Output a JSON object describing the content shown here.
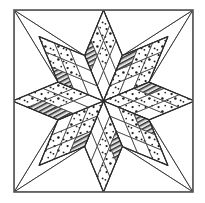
{
  "figure": {
    "name": "eight-pointed-star-quilt-block",
    "title": "Eight-Pointed Star Quilt Block",
    "alt_title": "LeMoyne Star / Lone Star patchwork block diagram",
    "description": "Line-drawing diagram of a square patchwork quilt block containing an eight-pointed star. Each star point is a large diamond pieced from a three-by-three grid of smaller diamonds in dotted and dark-striped fabrics. Plain white squares fill the four corners and plain white triangles fill the four side openings.",
    "width": 205,
    "height": 203
  },
  "frame": {
    "x": 14,
    "y": 10,
    "width": 179,
    "height": 182,
    "stroke": "#555555",
    "stroke_width": 1.6,
    "fill": "#ffffff",
    "label": "block-outer-border"
  },
  "geometry": {
    "center_x": 103.5,
    "center_y": 101.0,
    "star_radius": 91.0,
    "point_half_angle_deg": 22.5,
    "subdivisions": 3,
    "point_count": 8
  },
  "colors": {
    "ink": "#2a2a2a",
    "line": "#3b3b3b",
    "frame": "#555555",
    "paper": "#ffffff",
    "plain_fill": "#ffffff",
    "dot_ink": "#1d1d1d",
    "stripe_dark": "#2b2b2b",
    "stripe_mid": "#6f6f6f",
    "stripe_light": "#bdbdbd"
  },
  "fabrics": [
    {
      "id": "plain",
      "label": "Plain white solid",
      "swatch": "#ffffff",
      "texture": "none"
    },
    {
      "id": "dotted",
      "label": "Dotted print",
      "swatch": "#f7f7f7",
      "texture": "scattered-dots"
    },
    {
      "id": "stripe",
      "label": "Dark diagonal stripe",
      "swatch": "#3a3a3a",
      "texture": "diagonal-hatch"
    }
  ],
  "star_points": [
    {
      "index": 0,
      "name": "star-point-n",
      "direction": "north",
      "angle_deg": 270,
      "cells": [
        [
          "plain",
          "plain",
          "plain"
        ],
        [
          "plain",
          "dotted",
          "dotted"
        ],
        [
          "stripe",
          "dotted",
          "dotted"
        ]
      ]
    },
    {
      "index": 1,
      "name": "star-point-ne",
      "direction": "northeast",
      "angle_deg": 315,
      "cells": [
        [
          "dotted",
          "plain",
          "dotted"
        ],
        [
          "dotted",
          "dotted",
          "dotted"
        ],
        [
          "stripe",
          "dotted",
          "dotted"
        ]
      ]
    },
    {
      "index": 2,
      "name": "star-point-e",
      "direction": "east",
      "angle_deg": 0,
      "cells": [
        [
          "dotted",
          "dotted",
          "plain"
        ],
        [
          "dotted",
          "dotted",
          "dotted"
        ],
        [
          "stripe",
          "dotted",
          "dotted"
        ]
      ]
    },
    {
      "index": 3,
      "name": "star-point-se",
      "direction": "southeast",
      "angle_deg": 45,
      "cells": [
        [
          "plain",
          "plain",
          "plain"
        ],
        [
          "dotted",
          "dotted",
          "plain"
        ],
        [
          "stripe",
          "dotted",
          "dotted"
        ]
      ]
    },
    {
      "index": 4,
      "name": "star-point-s",
      "direction": "south",
      "angle_deg": 90,
      "cells": [
        [
          "plain",
          "plain",
          "plain"
        ],
        [
          "dotted",
          "dotted",
          "plain"
        ],
        [
          "stripe",
          "dotted",
          "dotted"
        ]
      ]
    },
    {
      "index": 5,
      "name": "star-point-sw",
      "direction": "southwest",
      "angle_deg": 135,
      "cells": [
        [
          "dotted",
          "dotted",
          "plain"
        ],
        [
          "dotted",
          "dotted",
          "dotted"
        ],
        [
          "stripe",
          "dotted",
          "dotted"
        ]
      ]
    },
    {
      "index": 6,
      "name": "star-point-w",
      "direction": "west",
      "angle_deg": 180,
      "cells": [
        [
          "plain",
          "dotted",
          "dotted"
        ],
        [
          "plain",
          "dotted",
          "dotted"
        ],
        [
          "stripe",
          "stripe",
          "dotted"
        ]
      ]
    },
    {
      "index": 7,
      "name": "star-point-nw",
      "direction": "northwest",
      "angle_deg": 225,
      "cells": [
        [
          "plain",
          "plain",
          "plain"
        ],
        [
          "plain",
          "dotted",
          "dotted"
        ],
        [
          "stripe",
          "dotted",
          "dotted"
        ]
      ]
    }
  ],
  "corner_squares": [
    {
      "name": "corner-square-nw",
      "label": "Top-left corner square",
      "fabric": "plain"
    },
    {
      "name": "corner-square-ne",
      "label": "Top-right corner square",
      "fabric": "plain"
    },
    {
      "name": "corner-square-se",
      "label": "Bottom-right corner square",
      "fabric": "plain"
    },
    {
      "name": "corner-square-sw",
      "label": "Bottom-left corner square",
      "fabric": "plain"
    }
  ],
  "side_triangles": [
    {
      "name": "side-triangle-n",
      "label": "Top side triangle",
      "fabric": "plain"
    },
    {
      "name": "side-triangle-e",
      "label": "Right side triangle",
      "fabric": "plain"
    },
    {
      "name": "side-triangle-s",
      "label": "Bottom side triangle",
      "fabric": "plain"
    },
    {
      "name": "side-triangle-w",
      "label": "Left side triangle",
      "fabric": "plain"
    }
  ]
}
